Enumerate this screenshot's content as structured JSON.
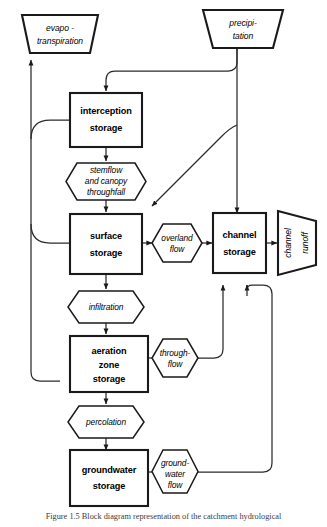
{
  "diagram": {
    "caption": "Figure 1.5  Block diagram representation of the catchment hydrological",
    "colors": {
      "outline": "#1a1a1a",
      "connector": "#2b2b2b",
      "background": "#ffffff"
    },
    "inputs": [
      {
        "id": "precipitation",
        "shape": "trapezoid",
        "lines": [
          "precipi-",
          "tation"
        ]
      }
    ],
    "outputs": [
      {
        "id": "evapotranspiration",
        "shape": "inverted-trapezoid",
        "lines": [
          "evapo -",
          "transpiration"
        ]
      },
      {
        "id": "channel-runoff",
        "shape": "trapezoid-rotated",
        "lines": [
          "channel",
          "runoff"
        ]
      }
    ],
    "stores": [
      {
        "id": "interception-storage",
        "shape": "rectangle",
        "lines": [
          "interception",
          "storage"
        ]
      },
      {
        "id": "surface-storage",
        "shape": "rectangle",
        "lines": [
          "surface",
          "storage"
        ]
      },
      {
        "id": "aeration-zone-storage",
        "shape": "rectangle",
        "lines": [
          "aeration",
          "zone",
          "storage"
        ]
      },
      {
        "id": "groundwater-storage",
        "shape": "rectangle",
        "lines": [
          "groundwater",
          "storage"
        ]
      },
      {
        "id": "channel-storage",
        "shape": "rectangle",
        "lines": [
          "channel",
          "storage"
        ]
      }
    ],
    "fluxes": [
      {
        "id": "stemflow-canopy-throughfall",
        "shape": "hexagon",
        "lines": [
          "stemflow",
          "and canopy",
          "throughfall"
        ]
      },
      {
        "id": "overland-flow",
        "shape": "hexagon",
        "lines": [
          "overland",
          "flow"
        ]
      },
      {
        "id": "infiltration",
        "shape": "hexagon",
        "lines": [
          "infiltration"
        ]
      },
      {
        "id": "through-flow",
        "shape": "hexagon",
        "lines": [
          "through-",
          "flow"
        ]
      },
      {
        "id": "percolation",
        "shape": "hexagon",
        "lines": [
          "percolation"
        ]
      },
      {
        "id": "groundwater-flow",
        "shape": "hexagon",
        "lines": [
          "ground-",
          "water",
          "flow"
        ]
      }
    ],
    "labels": {
      "precipitation_l1": "precipi-",
      "precipitation_l2": "tation",
      "evapo_l1": "evapo -",
      "evapo_l2": "transpiration",
      "channel_runoff_l1": "channel",
      "channel_runoff_l2": "runoff",
      "interception_l1": "interception",
      "interception_l2": "storage",
      "surface_l1": "surface",
      "surface_l2": "storage",
      "aeration_l1": "aeration",
      "aeration_l2": "zone",
      "aeration_l3": "storage",
      "groundwater_l1": "groundwater",
      "groundwater_l2": "storage",
      "channel_storage_l1": "channel",
      "channel_storage_l2": "storage",
      "stemflow_l1": "stemflow",
      "stemflow_l2": "and canopy",
      "stemflow_l3": "throughfall",
      "overland_l1": "overland",
      "overland_l2": "flow",
      "infiltration_l1": "infiltration",
      "throughflow_l1": "through-",
      "throughflow_l2": "flow",
      "percolation_l1": "percolation",
      "gwflow_l1": "ground-",
      "gwflow_l2": "water",
      "gwflow_l3": "flow"
    }
  }
}
